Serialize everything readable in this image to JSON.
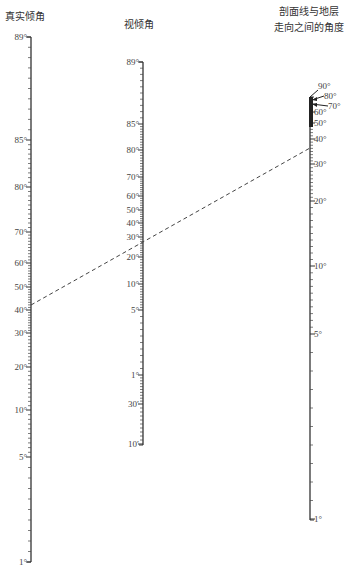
{
  "diagram": {
    "type": "nomogram",
    "axes": [
      {
        "id": "true-dip",
        "title": "真实倾角",
        "x": 31,
        "y_top": 37,
        "y_bottom": 562,
        "labels": [
          {
            "text": "89°",
            "y": 37
          },
          {
            "text": "85°",
            "y": 140
          },
          {
            "text": "80°",
            "y": 187
          },
          {
            "text": "70°",
            "y": 232
          },
          {
            "text": "60°",
            "y": 263
          },
          {
            "text": "50°",
            "y": 287
          },
          {
            "text": "40°",
            "y": 310
          },
          {
            "text": "30°",
            "y": 333
          },
          {
            "text": "20°",
            "y": 367
          },
          {
            "text": "10°",
            "y": 410
          },
          {
            "text": "5°",
            "y": 457
          },
          {
            "text": "1°",
            "y": 562
          }
        ]
      },
      {
        "id": "apparent-dip",
        "title": "视倾角",
        "x": 143,
        "y_top": 62,
        "y_bottom": 445,
        "labels": [
          {
            "text": "89°",
            "y": 62
          },
          {
            "text": "85°",
            "y": 124
          },
          {
            "text": "80°",
            "y": 150
          },
          {
            "text": "70°",
            "y": 177
          },
          {
            "text": "60°",
            "y": 196
          },
          {
            "text": "50°",
            "y": 210
          },
          {
            "text": "40°",
            "y": 223
          },
          {
            "text": "30°",
            "y": 237
          },
          {
            "text": "20°",
            "y": 257
          },
          {
            "text": "10°",
            "y": 284
          },
          {
            "text": "5°",
            "y": 310
          },
          {
            "text": "1°",
            "y": 375
          },
          {
            "text": "30′",
            "y": 404
          },
          {
            "text": "10′",
            "y": 444
          }
        ]
      },
      {
        "id": "section-strike-angle",
        "title_line1": "剖面线与地层",
        "title_line2": "走向之间的角度",
        "x": 310,
        "y_top": 97,
        "y_bottom": 520,
        "labels": [
          {
            "text": "90°",
            "y": 86,
            "dx": 8
          },
          {
            "text": "80°",
            "y": 96,
            "dx": 14
          },
          {
            "text": "70°",
            "y": 106,
            "dx": 18
          },
          {
            "text": "60°",
            "y": 112,
            "dx": 4
          },
          {
            "text": "50°",
            "y": 123,
            "dx": 4
          },
          {
            "text": "40°",
            "y": 139,
            "dx": 4
          },
          {
            "text": "30°",
            "y": 164,
            "dx": 4
          },
          {
            "text": "20°",
            "y": 201,
            "dx": 4
          },
          {
            "text": "10°",
            "y": 266,
            "dx": 4
          },
          {
            "text": "5°",
            "y": 334,
            "dx": 4
          },
          {
            "text": "1°",
            "y": 519,
            "dx": 4
          }
        ]
      }
    ],
    "example_line": {
      "x1": 31,
      "y1": 305,
      "x2": 310,
      "y2": 148,
      "style": "dashed"
    }
  }
}
